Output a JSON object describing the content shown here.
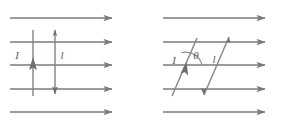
{
  "figure": {
    "background_color": "#ffffff",
    "line_color": "#7a7a7a",
    "label_color": "#5e5e5e",
    "panels": [
      {
        "id": "left-panel",
        "name": "perpendicular-conductor-panel",
        "description": "Conductor perpendicular to uniform field lines",
        "field": {
          "name": "uniform-magnetic-field",
          "arrow_count": 5,
          "direction": "right",
          "x_start": 10,
          "x_end": 112,
          "y_positions": [
            18,
            42,
            65,
            89,
            112
          ]
        },
        "conductors": [
          {
            "id": "left-wire",
            "name": "current-wire-up",
            "label": "I",
            "direction": "up",
            "x": 33,
            "y_top": 30,
            "y_bottom": 96,
            "label_x": 17,
            "label_y": 59
          },
          {
            "id": "right-wire",
            "name": "current-wire-down",
            "label": "l",
            "direction": "down",
            "x": 55,
            "y_top": 30,
            "y_bottom": 94,
            "label_x": 62,
            "label_y": 59
          }
        ]
      },
      {
        "id": "right-panel",
        "name": "inclined-conductor-panel",
        "description": "Conductor inclined at angle theta to uniform field lines",
        "field": {
          "name": "uniform-magnetic-field",
          "arrow_count": 5,
          "direction": "right",
          "x_start": 163,
          "x_end": 265,
          "y_positions": [
            18,
            42,
            65,
            89,
            112
          ]
        },
        "conductors": [
          {
            "id": "left-slant-wire",
            "name": "current-wire-up-inclined",
            "label": "I",
            "direction": "up",
            "x_bottom": 172,
            "y_bottom": 96,
            "x_top": 197,
            "y_top": 38,
            "label_x": 174,
            "label_y": 62
          },
          {
            "id": "right-slant-wire",
            "name": "current-wire-down-inclined",
            "label": "l",
            "direction": "down",
            "x_bottom": 204,
            "y_bottom": 95,
            "x_top": 229,
            "y_top": 37,
            "label_x": 213,
            "label_y": 62
          }
        ],
        "angle": {
          "name": "angle-theta",
          "symbol": "θ",
          "label_x": 197,
          "label_y": 59,
          "vertex_x": 185,
          "vertex_y": 65,
          "between": [
            "inclined-conductor",
            "field-line"
          ]
        }
      }
    ]
  }
}
